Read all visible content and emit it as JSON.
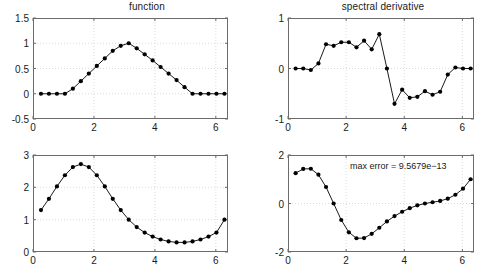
{
  "figure": {
    "width": 483,
    "height": 274,
    "background": "#ffffff",
    "line_color": "#000000",
    "marker_color": "#000000",
    "axis_color": "#6b6b6b",
    "grid_color": "#cccccc"
  },
  "chart_data": [
    {
      "id": "top-left",
      "type": "line",
      "title": "function",
      "xlabel": "",
      "ylabel": "",
      "xlim": [
        0,
        6.4
      ],
      "ylim": [
        -0.5,
        1.5
      ],
      "xticks": [
        0,
        2,
        4,
        6
      ],
      "xticklabels": [
        "0",
        "2",
        "4",
        "6"
      ],
      "yticks": [
        -0.5,
        0,
        0.5,
        1,
        1.5
      ],
      "yticklabels": [
        "-0.5",
        "0",
        "0.5",
        "1",
        "1.5"
      ],
      "grid": true,
      "legend": "none",
      "marker": "filled-circle",
      "x": [
        0.2618,
        0.5236,
        0.7854,
        1.0472,
        1.309,
        1.5708,
        1.8326,
        2.0944,
        2.3562,
        2.618,
        2.8798,
        3.1416,
        3.4034,
        3.6652,
        3.927,
        4.1888,
        4.4506,
        4.7124,
        4.9742,
        5.236,
        5.4978,
        5.7596,
        6.0214,
        6.2832
      ],
      "y": [
        0.0,
        0.0,
        0.0,
        0.0,
        0.1,
        0.25,
        0.4,
        0.55,
        0.7,
        0.85,
        0.95,
        1.0,
        0.9,
        0.78,
        0.66,
        0.53,
        0.4,
        0.27,
        0.13,
        0.0,
        0.0,
        0.0,
        0.0,
        0.0
      ]
    },
    {
      "id": "top-right",
      "type": "line",
      "title": "spectral derivative",
      "xlabel": "",
      "ylabel": "",
      "xlim": [
        0,
        6.4
      ],
      "ylim": [
        -1,
        1
      ],
      "xticks": [
        0,
        2,
        4,
        6
      ],
      "xticklabels": [
        "0",
        "2",
        "4",
        "6"
      ],
      "yticks": [
        -1,
        0,
        1
      ],
      "yticklabels": [
        "-1",
        "0",
        "1"
      ],
      "grid": true,
      "legend": "none",
      "marker": "filled-circle",
      "x": [
        0.2618,
        0.5236,
        0.7854,
        1.0472,
        1.309,
        1.5708,
        1.8326,
        2.0944,
        2.3562,
        2.618,
        2.8798,
        3.1416,
        3.4034,
        3.6652,
        3.927,
        4.1888,
        4.4506,
        4.7124,
        4.9742,
        5.236,
        5.4978,
        5.7596,
        6.0214,
        6.2832
      ],
      "y": [
        0.0,
        0.0,
        -0.03,
        0.1,
        0.48,
        0.45,
        0.52,
        0.52,
        0.42,
        0.55,
        0.38,
        0.68,
        0.0,
        -0.7,
        -0.42,
        -0.58,
        -0.56,
        -0.45,
        -0.52,
        -0.46,
        -0.12,
        0.02,
        0.0,
        0.0
      ]
    },
    {
      "id": "bottom-left",
      "type": "line",
      "title": "",
      "xlabel": "",
      "ylabel": "",
      "xlim": [
        0,
        6.4
      ],
      "ylim": [
        0,
        3
      ],
      "xticks": [
        0,
        2,
        4,
        6
      ],
      "xticklabels": [
        "0",
        "2",
        "4",
        "6"
      ],
      "yticks": [
        0,
        1,
        2,
        3
      ],
      "yticklabels": [
        "0",
        "1",
        "2",
        "3"
      ],
      "grid": true,
      "legend": "none",
      "marker": "filled-circle",
      "x": [
        0.2618,
        0.5236,
        0.7854,
        1.0472,
        1.309,
        1.5708,
        1.8326,
        2.0944,
        2.3562,
        2.618,
        2.8798,
        3.1416,
        3.4034,
        3.6652,
        3.927,
        4.1888,
        4.4506,
        4.7124,
        4.9742,
        5.236,
        5.4978,
        5.7596,
        6.0214,
        6.2832
      ],
      "y": [
        1.296,
        1.646,
        2.028,
        2.374,
        2.626,
        2.718,
        2.626,
        2.374,
        2.028,
        1.646,
        1.296,
        1.0,
        0.772,
        0.601,
        0.476,
        0.387,
        0.327,
        0.297,
        0.297,
        0.327,
        0.387,
        0.476,
        0.601,
        1.0
      ]
    },
    {
      "id": "bottom-right",
      "type": "line",
      "title": "",
      "xlabel": "",
      "ylabel": "",
      "xlim": [
        0,
        6.4
      ],
      "ylim": [
        -2,
        2
      ],
      "xticks": [
        0,
        2,
        4,
        6
      ],
      "xticklabels": [
        "0",
        "2",
        "4",
        "6"
      ],
      "yticks": [
        -2,
        0,
        2
      ],
      "yticklabels": [
        "-2",
        "0",
        "2"
      ],
      "grid": true,
      "legend": "none",
      "marker": "filled-circle",
      "annotation": "max error = 9.5679e−13",
      "x": [
        0.2618,
        0.5236,
        0.7854,
        1.0472,
        1.309,
        1.5708,
        1.8326,
        2.0944,
        2.3562,
        2.618,
        2.8798,
        3.1416,
        3.4034,
        3.6652,
        3.927,
        4.1888,
        4.4506,
        4.7124,
        4.9742,
        5.236,
        5.4978,
        5.7596,
        6.0214,
        6.2832
      ],
      "y": [
        1.252,
        1.425,
        1.434,
        1.187,
        0.68,
        0.0,
        -0.68,
        -1.187,
        -1.434,
        -1.425,
        -1.252,
        -1.0,
        -0.74,
        -0.52,
        -0.34,
        -0.194,
        -0.077,
        0.0,
        0.052,
        0.105,
        0.2,
        0.36,
        0.61,
        1.0
      ]
    }
  ]
}
